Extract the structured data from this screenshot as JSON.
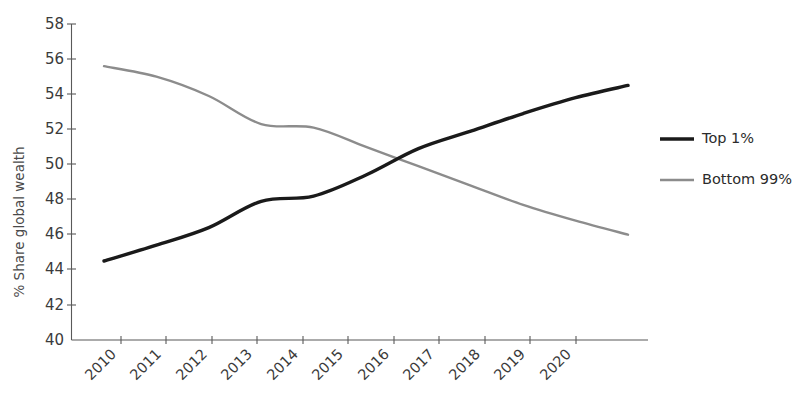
{
  "chart_data": {
    "type": "line",
    "title": "",
    "subtitle": "",
    "xlabel": "",
    "ylabel": "% Share global wealth",
    "categories": [
      "2010",
      "2011",
      "2012",
      "2013",
      "2014",
      "2015",
      "2016",
      "2017",
      "2018",
      "2019",
      "2020"
    ],
    "x": [
      2010,
      2011,
      2012,
      2013,
      2014,
      2015,
      2016,
      2017,
      2018,
      2019,
      2020
    ],
    "ylim": [
      40,
      58
    ],
    "yticks": [
      40,
      42,
      44,
      46,
      48,
      50,
      52,
      54,
      56,
      58
    ],
    "grid": false,
    "legend_position": "right",
    "series": [
      {
        "name": "Top 1%",
        "color": "#1a1a1a",
        "values": [
          44.5,
          45.4,
          46.4,
          47.9,
          48.2,
          49.4,
          50.9,
          51.9,
          52.9,
          53.8,
          54.5
        ]
      },
      {
        "name": "Bottom 99%",
        "color": "#8c8c8c",
        "values": [
          55.6,
          55.0,
          53.9,
          52.3,
          52.1,
          51.0,
          49.9,
          48.8,
          47.7,
          46.8,
          46.0
        ]
      }
    ]
  },
  "axes": {
    "y_axis_title": "% Share global wealth",
    "y_tick_labels": [
      "58",
      "56",
      "54",
      "52",
      "50",
      "48",
      "46",
      "44",
      "42",
      "40"
    ],
    "x_tick_labels": [
      "2010",
      "2011",
      "2012",
      "2013",
      "2014",
      "2015",
      "2016",
      "2017",
      "2018",
      "2019",
      "2020"
    ]
  },
  "legend": {
    "items": [
      {
        "label": "Top 1%",
        "color": "#1a1a1a"
      },
      {
        "label": "Bottom 99%",
        "color": "#8c8c8c"
      }
    ]
  },
  "colors": {
    "top1_line": "#1a1a1a",
    "bottom99_line": "#8c8c8c",
    "axis": "#595959",
    "tick_text": "#3b3b3b",
    "background": "#ffffff"
  }
}
